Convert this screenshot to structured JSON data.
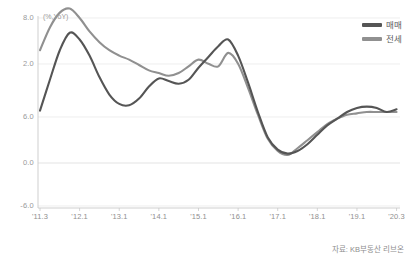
{
  "chart_data": {
    "type": "line",
    "title": "",
    "subtitle": "",
    "xlabel": "",
    "ylabel": "(%,YoY)",
    "unit_label": "(%,YoY)",
    "grid": true,
    "legend_position": "top-right",
    "ylim": [
      -6.0,
      8.0
    ],
    "yticks": [
      "8.0",
      "2.0",
      "6.0",
      "0.0",
      "-6.0"
    ],
    "ytick_values": [
      8.0,
      2.0,
      6.0,
      0.0,
      -6.0
    ],
    "xticks": [
      "'11.3",
      "'12.1",
      "'13.1",
      "'14.1",
      "'15.1",
      "'16.1",
      "'17.1",
      "'18.1",
      "'19.1",
      "'20.3"
    ],
    "source": "자료: KB부동산 리브온",
    "colors": {
      "series_sale": "#555555",
      "series_jeonse": "#909090",
      "axis": "#c8c8c8",
      "grid": "#e2e2e2",
      "text": "#8f8f8f",
      "background": "#ffffff"
    },
    "series": [
      {
        "name": "매매",
        "color": "#555555",
        "x": [
          "'11.3",
          "'11.6",
          "'11.9",
          "'12.1",
          "'12.4",
          "'12.7",
          "'12.10",
          "'13.1",
          "'13.4",
          "'13.7",
          "'13.10",
          "'14.1",
          "'14.4",
          "'14.7",
          "'14.10",
          "'15.1",
          "'15.4",
          "'15.7",
          "'15.10",
          "'16.1",
          "'16.4",
          "'16.7",
          "'16.10",
          "'17.1",
          "'17.4",
          "'17.7",
          "'17.10",
          "'18.1",
          "'18.4",
          "'18.7",
          "'18.10",
          "'19.1",
          "'19.4",
          "'19.7",
          "'19.10",
          "'20.1",
          "'20.3"
        ],
        "values": [
          1.1,
          3.4,
          5.6,
          6.9,
          6.4,
          5.2,
          3.6,
          2.3,
          1.6,
          1.5,
          2.0,
          2.9,
          3.5,
          3.3,
          3.1,
          3.4,
          4.3,
          5.1,
          5.9,
          6.4,
          5.2,
          3.2,
          1.0,
          -0.9,
          -1.8,
          -2.1,
          -1.9,
          -1.4,
          -0.7,
          0.0,
          0.5,
          1.0,
          1.3,
          1.4,
          1.3,
          1.0,
          1.2
        ]
      },
      {
        "name": "전세",
        "color": "#909090",
        "x": [
          "'11.3",
          "'11.6",
          "'11.9",
          "'12.1",
          "'12.4",
          "'12.7",
          "'12.10",
          "'13.1",
          "'13.4",
          "'13.7",
          "'13.10",
          "'14.1",
          "'14.4",
          "'14.7",
          "'14.10",
          "'15.1",
          "'15.4",
          "'15.7",
          "'15.10",
          "'16.1",
          "'16.4",
          "'16.7",
          "'16.10",
          "'17.1",
          "'17.4",
          "'17.7",
          "'17.10",
          "'18.1",
          "'18.4",
          "'18.7",
          "'18.10",
          "'19.1",
          "'19.4",
          "'19.7",
          "'19.10",
          "'20.1",
          "'20.3"
        ],
        "values": [
          5.6,
          7.3,
          8.4,
          8.7,
          8.0,
          7.0,
          6.2,
          5.6,
          5.2,
          4.9,
          4.5,
          4.1,
          3.9,
          3.7,
          3.9,
          4.4,
          4.9,
          4.6,
          4.4,
          5.4,
          4.6,
          2.8,
          0.8,
          -1.0,
          -1.9,
          -2.2,
          -1.7,
          -1.1,
          -0.5,
          0.1,
          0.5,
          0.8,
          0.9,
          1.0,
          1.0,
          1.0,
          1.0
        ]
      }
    ]
  },
  "legend": {
    "items": [
      {
        "label": "매매",
        "color": "#555555"
      },
      {
        "label": "전세",
        "color": "#909090"
      }
    ]
  }
}
